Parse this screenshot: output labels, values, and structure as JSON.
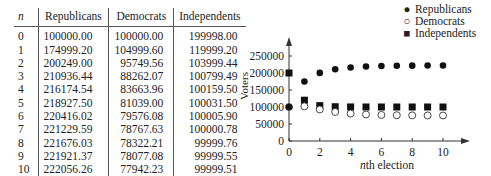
{
  "table": {
    "headers": [
      "n",
      "Republicans",
      "Democrats",
      "Independents"
    ],
    "rows": [
      [
        "0",
        "100000.00",
        "100000.00",
        "199998.00"
      ],
      [
        "1",
        "174999.20",
        "104999.60",
        "119999.20"
      ],
      [
        "2",
        "200249.00",
        "95749.56",
        "103999.44"
      ],
      [
        "3",
        "210936.44",
        "88262.07",
        "100799.49"
      ],
      [
        "4",
        "216174.54",
        "83663.96",
        "100159.50"
      ],
      [
        "5",
        "218927.50",
        "81039.00",
        "100031.50"
      ],
      [
        "6",
        "220416.02",
        "79576.08",
        "100005.90"
      ],
      [
        "7",
        "221229.59",
        "78767.63",
        "100000.78"
      ],
      [
        "8",
        "221676.03",
        "78322.21",
        "99999.76"
      ],
      [
        "9",
        "221921.37",
        "78077.08",
        "99999.55"
      ],
      [
        "10",
        "222056.26",
        "77942.23",
        "99999.51"
      ]
    ]
  },
  "legend": {
    "items": [
      {
        "marker": "filled-circle",
        "label": "Republicans"
      },
      {
        "marker": "open-circle",
        "label": "Democrats"
      },
      {
        "marker": "filled-square",
        "label": "Independents"
      }
    ]
  },
  "axis": {
    "xlabel_italic": "n",
    "xlabel_rest": "th election",
    "ylabel": "Voters"
  },
  "chart_data": {
    "type": "scatter",
    "title": "",
    "xlabel": "nth election",
    "ylabel": "Voters",
    "x": [
      0,
      1,
      2,
      3,
      4,
      5,
      6,
      7,
      8,
      9,
      10
    ],
    "xticks": [
      0,
      2,
      4,
      6,
      8,
      10
    ],
    "yticks": [
      0,
      50000,
      100000,
      150000,
      200000,
      250000
    ],
    "xlim": [
      0,
      11.5
    ],
    "ylim": [
      0,
      280000
    ],
    "grid": false,
    "legend_position": "top-right",
    "series": [
      {
        "name": "Republicans",
        "marker": "filled-circle",
        "values": [
          100000.0,
          174999.2,
          200249.0,
          210936.44,
          216174.54,
          218927.5,
          220416.02,
          221229.59,
          221676.03,
          221921.37,
          222056.26
        ]
      },
      {
        "name": "Democrats",
        "marker": "open-circle",
        "values": [
          100000.0,
          104999.6,
          95749.56,
          88262.07,
          83663.96,
          81039.0,
          79576.08,
          78767.63,
          78322.21,
          78077.08,
          77942.23
        ]
      },
      {
        "name": "Independents",
        "marker": "filled-square",
        "values": [
          199998.0,
          119999.2,
          103999.44,
          100799.49,
          100159.5,
          100031.5,
          100005.9,
          100000.78,
          99999.76,
          99999.55,
          99999.51
        ]
      }
    ]
  }
}
